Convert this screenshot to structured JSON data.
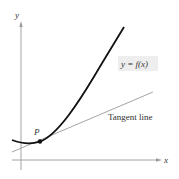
{
  "diagram": {
    "axes": {
      "x_label": "x",
      "y_label": "y"
    },
    "curve_label": "y = f(x)",
    "tangent_label": "Tangent line",
    "point_label": "P",
    "colors": {
      "curve": "#111111",
      "tangent": "#9a9a9a",
      "axis": "#9a9a9a",
      "label_box": "#eeeeee",
      "text": "#333333"
    }
  }
}
